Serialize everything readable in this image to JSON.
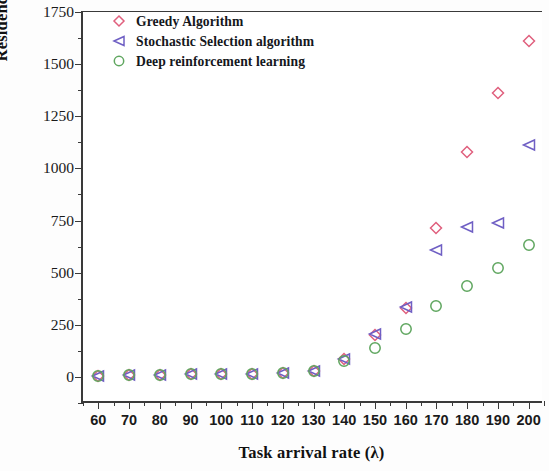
{
  "chart_data": {
    "type": "scatter",
    "title": "",
    "xlabel": "Task arrival rate (λ)",
    "ylabel": "Residence time (ms)",
    "x": [
      60,
      70,
      80,
      90,
      100,
      110,
      120,
      130,
      140,
      150,
      160,
      170,
      180,
      190,
      200
    ],
    "xlim": [
      55,
      205
    ],
    "ylim": [
      -130,
      1750
    ],
    "xticks": [
      60,
      70,
      80,
      90,
      100,
      110,
      120,
      130,
      140,
      150,
      160,
      170,
      180,
      190,
      200
    ],
    "yticks": [
      0,
      250,
      500,
      750,
      1000,
      1250,
      1500,
      1750
    ],
    "grid": false,
    "legend_position": "top-left",
    "series": [
      {
        "name": "Greedy Algorithm",
        "marker": "diamond",
        "color": "#e0607e",
        "values": [
          5,
          8,
          10,
          12,
          14,
          16,
          20,
          28,
          85,
          200,
          330,
          712,
          1080,
          1363,
          1613
        ]
      },
      {
        "name": "Stochastic Selection algorithm",
        "marker": "triangle-left",
        "color": "#6f5fc4",
        "values": [
          5,
          8,
          10,
          12,
          14,
          16,
          20,
          28,
          88,
          205,
          335,
          608,
          718,
          736,
          1113
        ]
      },
      {
        "name": "Deep reinforcement learning",
        "marker": "circle",
        "color": "#5fa65f",
        "values": [
          5,
          8,
          10,
          12,
          14,
          16,
          20,
          28,
          78,
          140,
          230,
          340,
          434,
          524,
          632
        ]
      }
    ]
  },
  "axes": {
    "y_tick_labels": [
      "0",
      "250",
      "500",
      "750",
      "1000",
      "1250",
      "1500",
      "1750"
    ],
    "x_tick_labels": [
      "60",
      "70",
      "80",
      "90",
      "100",
      "110",
      "120",
      "130",
      "140",
      "150",
      "160",
      "170",
      "180",
      "190",
      "200"
    ]
  },
  "legend": {
    "items": [
      {
        "label": "Greedy Algorithm",
        "marker": "diamond-icon",
        "color": "#e0607e"
      },
      {
        "label": "Stochastic Selection algorithm",
        "marker": "triangle-left-icon",
        "color": "#6f5fc4"
      },
      {
        "label": "Deep reinforcement learning",
        "marker": "circle-icon",
        "color": "#5fa65f"
      }
    ]
  }
}
